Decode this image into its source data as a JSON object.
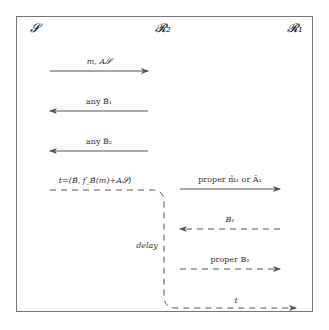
{
  "diagram": {
    "parties": [
      {
        "id": "S",
        "label": "𝓢"
      },
      {
        "id": "R2",
        "label": "𝓡₂"
      },
      {
        "id": "R1",
        "label": "𝓡₁"
      }
    ],
    "messages": [
      {
        "label": "m, A_S",
        "display": "m, A𝓢",
        "from": "S",
        "to": "R2",
        "style": "solid"
      },
      {
        "label": "any B̃_1",
        "display": "any B̃₁",
        "from": "R2",
        "to": "S",
        "style": "solid"
      },
      {
        "label": "any B̃_2",
        "display": "any B̃₂",
        "from": "R2",
        "to": "S",
        "style": "solid"
      },
      {
        "label": "t=(B̃, f_B̃(m)+A_S)",
        "display": "t=(B̃, f_B̃(m)+A𝓢)",
        "from": "S",
        "to": "R2",
        "style": "dashed"
      },
      {
        "label": "proper m̃_1 or Ã_1",
        "display": "proper m̃₁ or Ã₁",
        "from": "R2",
        "to": "R1",
        "style": "solid"
      },
      {
        "label": "B_1",
        "display": "B₁",
        "from": "R1",
        "to": "R2",
        "style": "dashed"
      },
      {
        "label": "proper B_2",
        "display": "proper B₂",
        "from": "R2",
        "to": "R1",
        "style": "dashed"
      },
      {
        "label": "t",
        "display": "t",
        "from": "R2",
        "to": "R1",
        "style": "dashed"
      }
    ],
    "annotations": [
      {
        "label": "delay",
        "display": "delay"
      }
    ],
    "colors": {
      "line": "#555555",
      "frame": "#777777",
      "text": "#333333"
    }
  }
}
